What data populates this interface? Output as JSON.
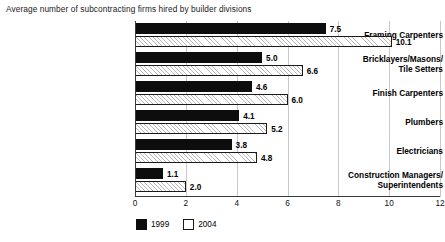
{
  "chart_data": {
    "type": "bar",
    "orientation": "horizontal",
    "title": "Average number of subcontracting firms hired by builder divisions",
    "xlabel": "",
    "ylabel": "",
    "xlim": [
      0,
      12
    ],
    "xticks": [
      0,
      2,
      4,
      6,
      8,
      10,
      12
    ],
    "xtick_labels": [
      "0",
      "2",
      "4",
      "6",
      "8",
      "10",
      "12"
    ],
    "grid": true,
    "grid_axis": "x",
    "legend_position": "bottom-left",
    "categories": [
      "Framing Carpenters",
      "Bricklayers/Masons/\nTile Setters",
      "Finish Carpenters",
      "Plumbers",
      "Electricians",
      "Construction Managers/\nSuperintendents"
    ],
    "series": [
      {
        "name": "1999",
        "color": "#0d0d0d",
        "values": [
          7.5,
          5.0,
          4.6,
          4.1,
          3.8,
          1.1
        ],
        "value_labels": [
          "7.5",
          "5.0",
          "4.6",
          "4.1",
          "3.8",
          "1.1"
        ]
      },
      {
        "name": "2004",
        "color": "#ffffff",
        "pattern": "diagonal-hatch",
        "values": [
          10.1,
          6.6,
          6.0,
          5.2,
          4.8,
          2.0
        ],
        "value_labels": [
          "10.1",
          "6.6",
          "6.0",
          "5.2",
          "4.8",
          "2.0"
        ]
      }
    ]
  },
  "legend": {
    "items": [
      {
        "label": "1999"
      },
      {
        "label": "2004"
      }
    ]
  },
  "colors": {
    "series_1999": "#0d0d0d",
    "series_2004": "#ffffff",
    "gridline": "#c8c8c8",
    "axis": "#3a3a3a",
    "background": "#ffffff"
  }
}
